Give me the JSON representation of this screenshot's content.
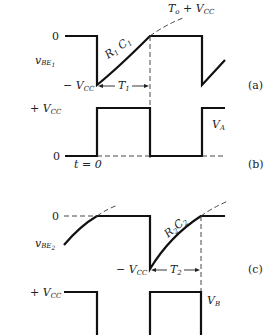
{
  "panels": {
    "a": {
      "tag": "(a)",
      "signal": "v",
      "signal_sub": "BE",
      "signal_sub2": "1",
      "level_zero": "0",
      "level_neg": "− V",
      "level_neg_sub": "CC",
      "curve_label": "R",
      "curve_sub1": "1",
      "curve_label2": "C",
      "curve_sub2": "1",
      "asymptote": "T",
      "asymptote_sub": "o",
      "asymptote_rest": " + V",
      "asymptote_rest_sub": "CC",
      "interval": "T",
      "interval_sub": "1"
    },
    "b": {
      "tag": "(b)",
      "signal": "V",
      "signal_sub": "A",
      "level_pos": "+ V",
      "level_pos_sub": "CC",
      "level_zero": "0",
      "time_label": "t = 0"
    },
    "c": {
      "tag": "(c)",
      "signal": "v",
      "signal_sub": "BE",
      "signal_sub2": "2",
      "level_zero": "0",
      "level_neg": "− V",
      "level_neg_sub": "CC",
      "curve_label": "R",
      "curve_sub1": "2",
      "curve_label2": "C",
      "curve_sub2": "2",
      "interval": "T",
      "interval_sub": "2"
    },
    "d": {
      "signal": "V",
      "signal_sub": "B",
      "level_pos": "+ V",
      "level_pos_sub": "CC"
    }
  }
}
